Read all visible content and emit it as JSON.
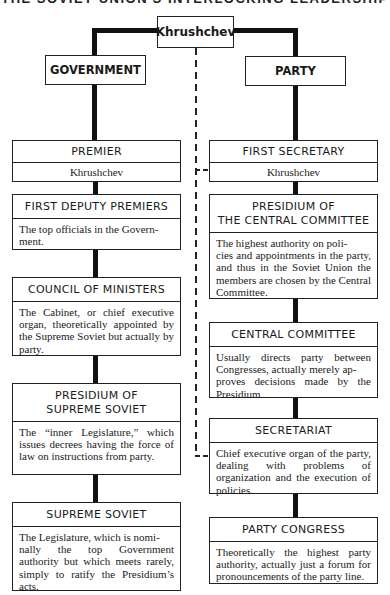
{
  "title": "THE SOVIET UNION'S INTERLOCKING LEADERSHIP",
  "top": {
    "leader": "Khrushchev",
    "government": "GOVERNMENT",
    "party": "PARTY"
  },
  "government": [
    {
      "heading": "PREMIER",
      "text": "Khrushchev"
    },
    {
      "heading": "FIRST DEPUTY PREMIERS",
      "text": "The top officials in the Government."
    },
    {
      "heading": "COUNCIL OF MINISTERS",
      "text": "The Cabinet, or chief executive organ, theoretically appointed by the Supreme Soviet but actually by party."
    },
    {
      "heading": "PRESIDIUM OF SUPREME SOVIET",
      "text": "The “inner Legislature,” which issues decrees having the force of law on instructions from party."
    },
    {
      "heading": "SUPREME SOVIET",
      "text": "The Legislature, which is nominally the top Government authority but which meets rarely, simply to ratify the Presidium’s acts."
    }
  ],
  "party": [
    {
      "heading": "FIRST SECRETARY",
      "text": "Khrushchev"
    },
    {
      "heading": "PRESIDIUM OF THE CENTRAL COMMITTEE",
      "text": "The highest authority on policies and appointments in the party, and thus in the Soviet Union the members are chosen by the Central Committee."
    },
    {
      "heading": "CENTRAL COMMITTEE",
      "text": "Usually directs party between Congresses, actually merely approves decisions made by the Presidium."
    },
    {
      "heading": "SECRETARIAT",
      "text": "Chief executive organ of the party, dealing with problems of organization and the execution of policies."
    },
    {
      "heading": "PARTY CONGRESS",
      "text": "Theoretically the highest party authority, actually just a forum for pronouncements of the party line."
    }
  ],
  "colors": {
    "line": "#111111",
    "box_border": "#222222",
    "background": "#ffffff"
  }
}
